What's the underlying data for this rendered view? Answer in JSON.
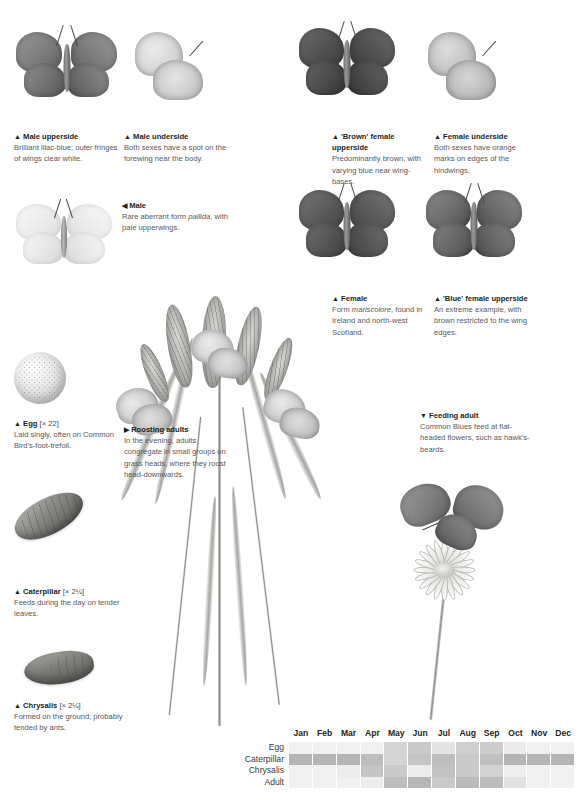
{
  "species": "Common Blue",
  "captions": [
    {
      "id": "male-upperside",
      "marker": "▲",
      "heading": "Male upperside",
      "body": "Brilliant lilac-blue; outer fringes of wings clear white."
    },
    {
      "id": "male-underside",
      "marker": "▲",
      "heading": "Male underside",
      "body": "Both sexes have a spot on the forewing near the body."
    },
    {
      "id": "brown-female-upperside",
      "marker": "▲",
      "heading": "'Brown' female upperside",
      "body": "Predominantly brown, with varying blue near wing-bases."
    },
    {
      "id": "female-underside",
      "marker": "▲",
      "heading": "Female underside",
      "body": "Both sexes have orange marks on edges of the hindwings."
    },
    {
      "id": "male-pallida",
      "marker": "◀",
      "heading": "Male",
      "body_before": "Rare aberrant form ",
      "body_italic": "pallida",
      "body_after": ", with pale upperwings."
    },
    {
      "id": "female-mariscolore",
      "marker": "▲",
      "heading": "Female",
      "body_before": "Form ",
      "body_italic": "mariscolore",
      "body_after": ", found in Ireland and north-west Scotland."
    },
    {
      "id": "blue-female-upperside",
      "marker": "▲",
      "heading": "'Blue' female upperside",
      "body": "An extreme example, with brown restricted to the wing edges."
    },
    {
      "id": "egg",
      "marker": "▲",
      "heading": "Egg",
      "magnification": "[× 22]",
      "body": "Laid singly, often on Common Bird's-foot-trefoil."
    },
    {
      "id": "roosting-adults",
      "marker": "▶",
      "heading": "Roosting adults",
      "body": "In the evening, adults congregate in small groups on grass heads, where they roost head-downwards."
    },
    {
      "id": "feeding-adult",
      "marker": "▼",
      "heading": "Feeding adult",
      "body": "Common Blues feed at flat-headed flowers, such as hawk's-beards."
    },
    {
      "id": "caterpillar",
      "marker": "▲",
      "heading": "Caterpillar",
      "magnification": "[× 2¼]",
      "body": "Feeds during the day on tender leaves."
    },
    {
      "id": "chrysalis",
      "marker": "▲",
      "heading": "Chrysalis",
      "magnification": "[× 2¼]",
      "body": "Formed on the ground; probably tended by ants."
    }
  ],
  "chart_data": {
    "type": "heatmap",
    "title": "",
    "xlabel": "",
    "ylabel": "",
    "categories": [
      "Jan",
      "Feb",
      "Mar",
      "Apr",
      "May",
      "Jun",
      "Jul",
      "Aug",
      "Sep",
      "Oct",
      "Nov",
      "Dec"
    ],
    "row_labels": [
      "Egg",
      "Caterpillar",
      "Chrysalis",
      "Adult"
    ],
    "legend": "Shading intensity indicates abundance of each life stage through the year",
    "series": [
      {
        "name": "Egg",
        "values": [
          0.0,
          0.0,
          0.0,
          0.0,
          0.22,
          0.3,
          0.1,
          0.26,
          0.28,
          0.05,
          0.0,
          0.0
        ]
      },
      {
        "name": "Caterpillar",
        "values": [
          0.46,
          0.46,
          0.46,
          0.4,
          0.22,
          0.34,
          0.4,
          0.3,
          0.38,
          0.46,
          0.46,
          0.46
        ]
      },
      {
        "name": "Chrysalis",
        "values": [
          0.0,
          0.0,
          0.04,
          0.34,
          0.3,
          0.04,
          0.36,
          0.3,
          0.24,
          0.02,
          0.0,
          0.0
        ]
      },
      {
        "name": "Adult",
        "values": [
          0.0,
          0.0,
          0.0,
          0.04,
          0.4,
          0.44,
          0.3,
          0.42,
          0.4,
          0.12,
          0.0,
          0.0
        ]
      }
    ],
    "shade_color": "#6f6f6f",
    "empty_color": "#f1f1f1"
  }
}
